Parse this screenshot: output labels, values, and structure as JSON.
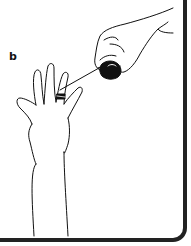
{
  "figure": {
    "panel_label": "b",
    "colors": {
      "line": "#111111",
      "frame": "#222222",
      "background": "#ffffff"
    }
  }
}
